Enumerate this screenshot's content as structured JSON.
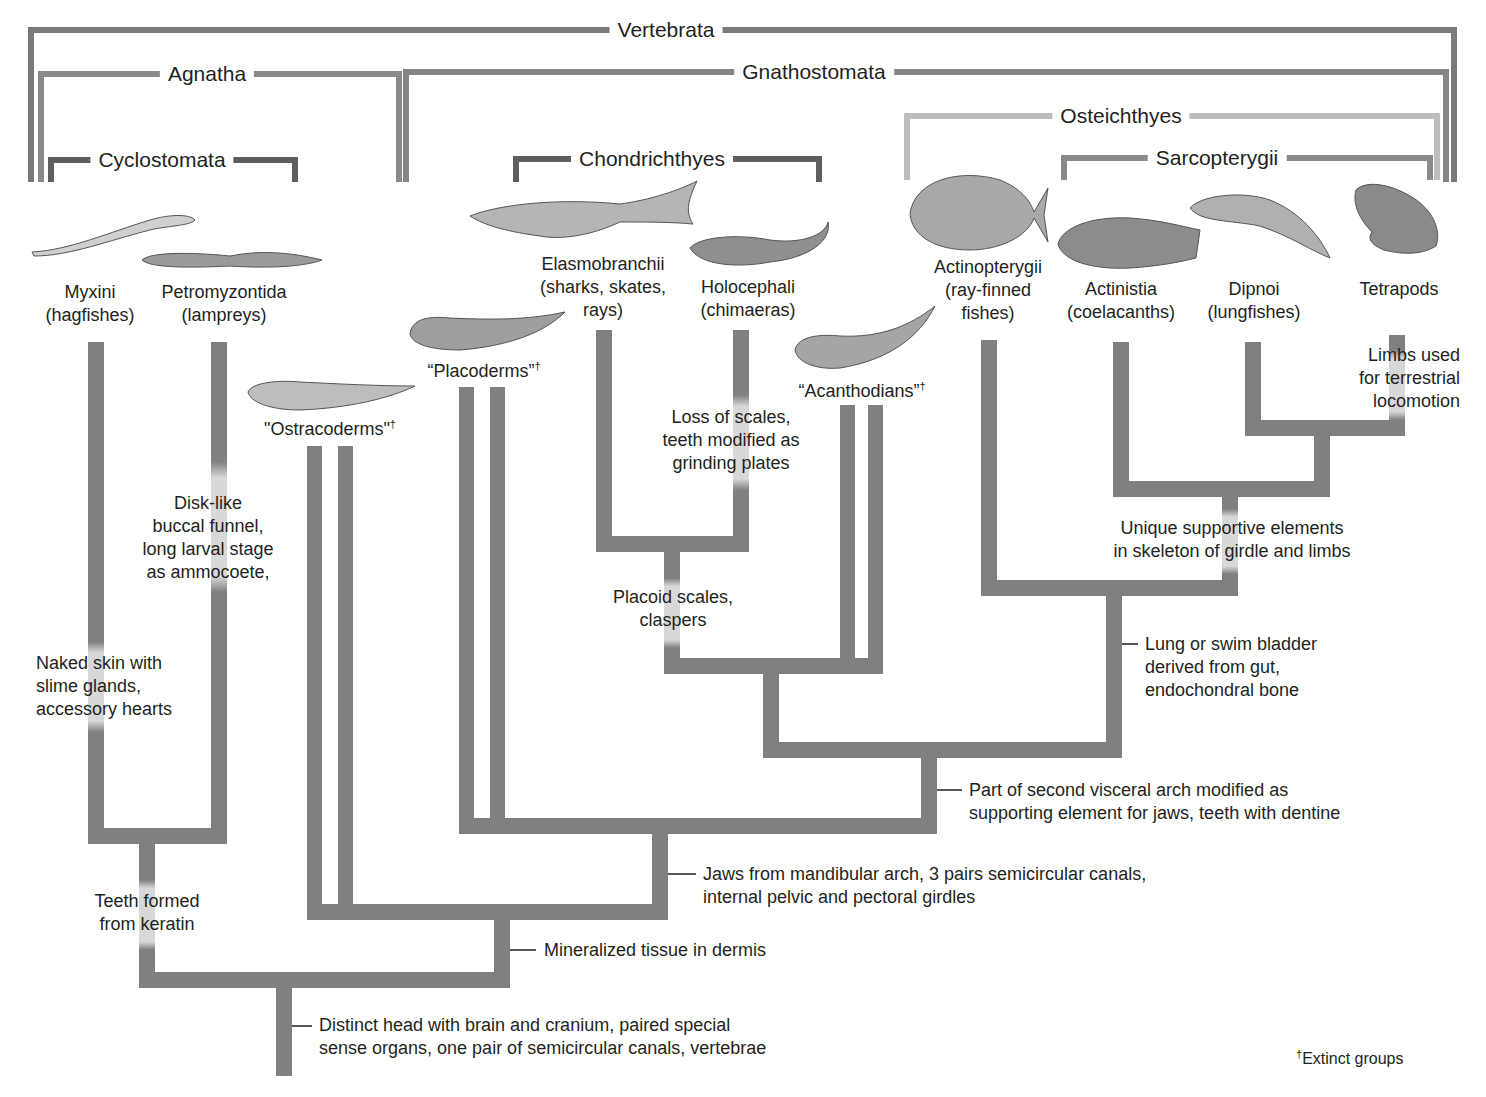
{
  "colors": {
    "branch": "#808080",
    "bracket_dark": "#6f6f6f",
    "bracket_light": "#b9b9b9",
    "highlight": "#d6d6d6",
    "text": "#231f20"
  },
  "groups": {
    "vertebrata": "Vertebrata",
    "agnatha": "Agnatha",
    "gnathostomata": "Gnathostomata",
    "cyclostomata": "Cyclostomata",
    "chondrichthyes": "Chondrichthyes",
    "osteichthyes": "Osteichthyes",
    "sarcopterygii": "Sarcopterygii"
  },
  "taxa": {
    "myxini": "Myxini\n(hagfishes)",
    "petromyzontida": "Petromyzontida\n(lampreys)",
    "ostracoderms": "\"Ostracoderms\"",
    "placoderms": "“Placoderms”",
    "elasmobranchii": "Elasmobranchii\n(sharks, skates,\nrays)",
    "holocephali": "Holocephali\n(chimaeras)",
    "acanthodians": "“Acanthodians”",
    "actinopterygii": "Actinopterygii\n(ray-finned\nfishes)",
    "actinistia": "Actinistia\n(coelacanths)",
    "dipnoi": "Dipnoi\n(lungfishes)",
    "tetrapods": "Tetrapods",
    "dagger": "†"
  },
  "traits": {
    "naked_skin": "Naked skin with\nslime glands,\naccessory hearts",
    "disk_like": "Disk-like\nbuccal funnel,\nlong larval stage\nas ammocoete,",
    "loss_scales": "Loss of scales,\nteeth modified as\ngrinding plates",
    "placoid": "Placoid scales,\nclaspers",
    "limbs": "Limbs used\nfor terrestrial\nlocomotion",
    "unique_support": "Unique supportive elements\nin skeleton of girdle and limbs",
    "lung": "Lung or swim bladder\nderived from gut,\nendochondral bone",
    "second_arch": "Part of second visceral arch modified as\nsupporting element for jaws, teeth with dentine",
    "jaws": "Jaws from mandibular arch, 3 pairs semicircular canals,\ninternal pelvic and pectoral girdles",
    "teeth_keratin": "Teeth formed\nfrom keratin",
    "mineralized": "Mineralized tissue in dermis",
    "distinct_head": "Distinct head with brain and cranium, paired special\nsense organs, one pair of semicircular canals, vertebrae"
  },
  "legend": {
    "dagger": "†",
    "text": "Extinct groups"
  },
  "illustrations": {
    "myxini": "hagfish-illustration",
    "petromyzontida": "lamprey-illustration",
    "ostracoderms": "ostracoderm-illustration",
    "placoderms": "placoderm-illustration",
    "elasmobranchii": "shark-illustration",
    "holocephali": "chimaera-illustration",
    "acanthodians": "acanthodian-illustration",
    "actinopterygii": "ray-finned-fish-illustration",
    "actinistia": "coelacanth-illustration",
    "dipnoi": "lungfish-illustration",
    "tetrapods": "frog-illustration"
  }
}
